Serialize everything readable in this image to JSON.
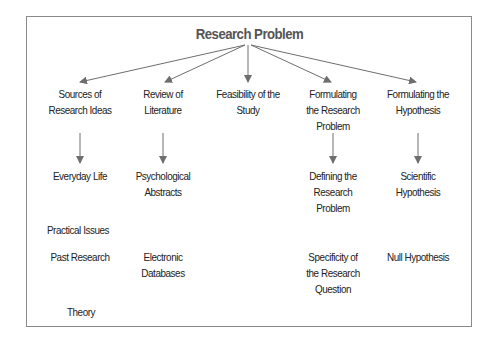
{
  "title": "Research Problem",
  "colors": {
    "arrow": "#6e6e6e",
    "border": "#8a8a8a",
    "title": "#555555",
    "text": "#222222"
  },
  "columns": [
    {
      "header": [
        "Sources of",
        "Research Ideas"
      ],
      "children": [
        "Everyday Life",
        "Practical Issues",
        "Past Research",
        "Theory"
      ]
    },
    {
      "header": [
        "Review of",
        "Literature"
      ],
      "children": [
        "Psychological Abstracts",
        "Electronic Databases"
      ]
    },
    {
      "header": [
        "Feasibility of the",
        "Study"
      ],
      "children": []
    },
    {
      "header": [
        "Formulating",
        "the Research",
        "Problem"
      ],
      "children": [
        "Defining the Research Problem",
        "Specificity of the Research Question"
      ]
    },
    {
      "header": [
        "Formulating the",
        "Hypothesis"
      ],
      "children": [
        "Scientific Hypothesis",
        "Null Hypothesis"
      ]
    }
  ],
  "labels": {
    "c0h1": "Sources of",
    "c0h2": "Research Ideas",
    "c1h1": "Review of",
    "c1h2": "Literature",
    "c2h1": "Feasibility of the",
    "c2h2": "Study",
    "c3h1": "Formulating",
    "c3h2": "the Research",
    "c3h3": "Problem",
    "c4h1": "Formulating the",
    "c4h2": "Hypothesis",
    "everyday": "Everyday Life",
    "practical": "Practical Issues",
    "past": "Past Research",
    "theory": "Theory",
    "psych1": "Psychological",
    "psych2": "Abstracts",
    "elec1": "Electronic",
    "elec2": "Databases",
    "def1": "Defining the",
    "def2": "Research",
    "def3": "Problem",
    "spec1": "Specificity of",
    "spec2": "the Research",
    "spec3": "Question",
    "sci1": "Scientific",
    "sci2": "Hypothesis",
    "null": "Null Hypothesis"
  }
}
